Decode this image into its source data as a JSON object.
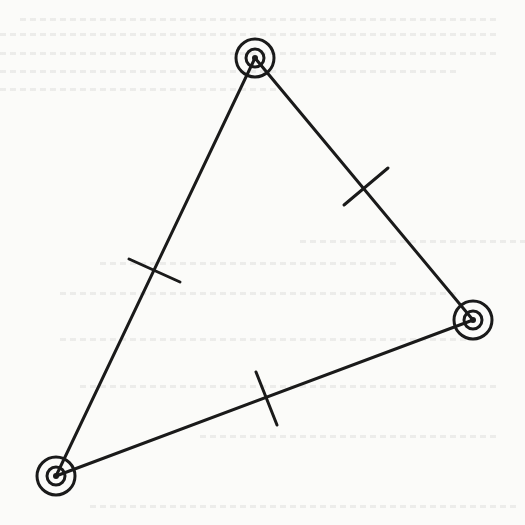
{
  "diagram": {
    "type": "equilateral-triangle",
    "stroke_color": "#1a1a1a",
    "background_color": "#fbfbf9",
    "vertices": [
      {
        "id": "top",
        "x": 255,
        "y": 58
      },
      {
        "id": "right",
        "x": 473,
        "y": 320
      },
      {
        "id": "bottom-left",
        "x": 56,
        "y": 476
      }
    ],
    "vertex_marker": {
      "outer_radius": 19,
      "inner_radius": 9,
      "dot_radius": 3
    },
    "edges": [
      {
        "from": "top",
        "to": "bottom-left",
        "tick": {
          "x1": 129,
          "y1": 259,
          "x2": 180,
          "y2": 282
        }
      },
      {
        "from": "top",
        "to": "right",
        "tick": {
          "x1": 344,
          "y1": 205,
          "x2": 388,
          "y2": 168
        }
      },
      {
        "from": "bottom-left",
        "to": "right",
        "tick": {
          "x1": 256,
          "y1": 372,
          "x2": 277,
          "y2": 425
        }
      }
    ],
    "tick_marks_per_edge": 1
  }
}
